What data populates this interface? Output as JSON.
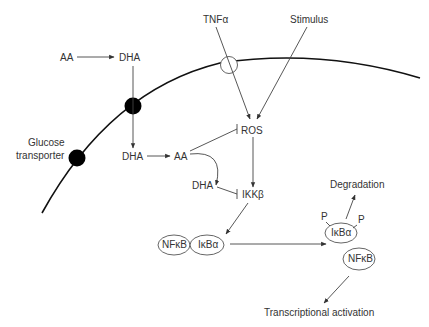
{
  "diagram": {
    "labels": {
      "tnf": "TNFα",
      "stimulus": "Stimulus",
      "aa_out": "AA",
      "dha_out": "DHA",
      "glucose1": "Glucose",
      "glucose2": "transporter",
      "dha_in": "DHA",
      "aa_in": "AA",
      "ros": "ROS",
      "dha_mid": "DHA",
      "ikkb": "IKKβ",
      "nfkb1": "NFκB",
      "ikba1": "IκBα",
      "degradation": "Degradation",
      "p1": "P",
      "p2": "P",
      "ikba2": "IκBα",
      "nfkb2": "NFκB",
      "transcription": "Transcriptional activation"
    },
    "colors": {
      "membrane": "#111111",
      "line": "#444444",
      "text": "#333333",
      "transporter": "#000000"
    }
  }
}
